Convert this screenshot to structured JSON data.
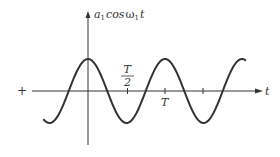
{
  "diagram": {
    "y_axis_label": {
      "a": "a",
      "sub1": "1",
      "cos": "cos",
      "omega": "ω",
      "sub2": "1",
      "t": "t"
    },
    "x_axis_label": "t",
    "origin_marker": "+",
    "tick_labels": {
      "half_period": {
        "numerator": "T",
        "denominator": "2"
      },
      "period": "T"
    },
    "colors": {
      "stroke": "#333333",
      "background": "#ffffff"
    }
  },
  "chart_data": {
    "type": "line",
    "xlabel": "t",
    "ylabel": "a1 cos ω1 t",
    "function": "a1*cos(2*pi*t/T)",
    "x_ticks": [
      "T/2",
      "T",
      "3T/2"
    ],
    "x_range_periods": [
      -0.58,
      2.05
    ],
    "grid": false
  }
}
